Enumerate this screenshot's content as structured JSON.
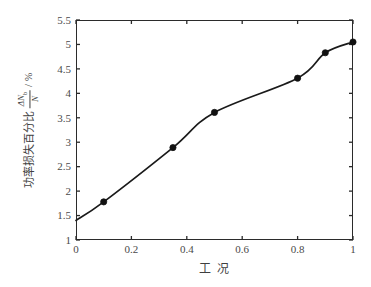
{
  "chart_data": {
    "type": "line",
    "title": "",
    "subtitle": "",
    "xlabel": "工 况",
    "ylabel_cjk": "功率损失百分比",
    "ylabel_fraction_numerator": "ΔN",
    "ylabel_fraction_numerator_sub": "b",
    "ylabel_fraction_denominator": "N",
    "ylabel_separator": "/",
    "ylabel_unit": "%",
    "xlim": [
      0,
      1
    ],
    "ylim": [
      1,
      5.5
    ],
    "xticks": [
      "0",
      "0.2",
      "0.4",
      "0.6",
      "0.8",
      "1"
    ],
    "xtick_values": [
      0,
      0.2,
      0.4,
      0.6,
      0.8,
      1
    ],
    "yticks": [
      "1",
      "1.5",
      "2",
      "2.5",
      "3",
      "3.5",
      "4",
      "4.5",
      "5",
      "5.5"
    ],
    "ytick_values": [
      1,
      1.5,
      2,
      2.5,
      3,
      3.5,
      4,
      4.5,
      5,
      5.5
    ],
    "grid": false,
    "legend": null,
    "legend_position": "none",
    "line_color": "#1a1a1a",
    "marker_color": "#111111",
    "marker_style": "filled-circle",
    "series": [
      {
        "name": "功率损失百分比",
        "x": [
          0.1,
          0.35,
          0.5,
          0.8,
          0.9,
          1.0
        ],
        "values": [
          1.78,
          2.89,
          3.61,
          4.31,
          4.83,
          5.05
        ]
      }
    ],
    "curve_start": {
      "x": 0.0,
      "y": 1.4
    },
    "annotations": []
  },
  "axis_titles": {
    "x": "工 况",
    "y_prefix": "功率损失百分比",
    "y_unit": "%"
  }
}
